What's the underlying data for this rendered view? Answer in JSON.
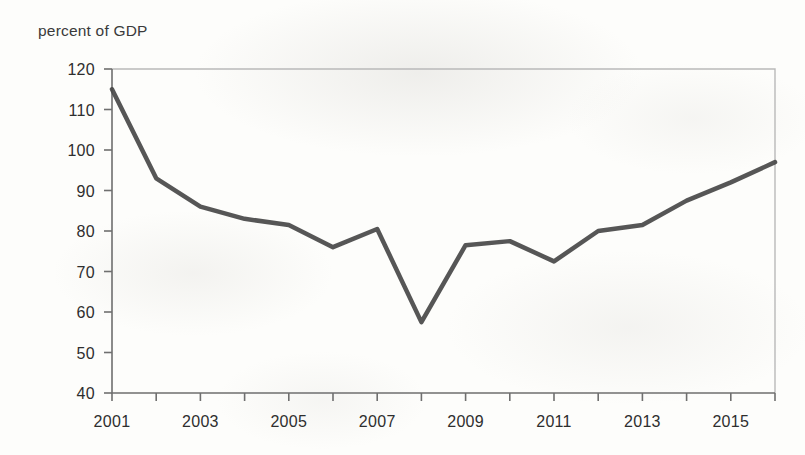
{
  "chart_data": {
    "type": "line",
    "title": "percent of GDP",
    "xlabel": "",
    "ylabel": "percent of GDP",
    "x": [
      2001,
      2002,
      2003,
      2004,
      2005,
      2006,
      2007,
      2008,
      2009,
      2010,
      2011,
      2012,
      2013,
      2014,
      2015,
      2016
    ],
    "values": [
      115,
      93,
      86,
      83,
      81.5,
      76,
      80.5,
      57.5,
      76.5,
      77.5,
      72.5,
      80,
      81.5,
      87.5,
      92,
      97
    ],
    "series": [
      {
        "name": "percent of GDP",
        "values": [
          115,
          93,
          86,
          83,
          81.5,
          76,
          80.5,
          57.5,
          76.5,
          77.5,
          72.5,
          80,
          81.5,
          87.5,
          92,
          97
        ]
      }
    ],
    "xlim": [
      2001,
      2016
    ],
    "ylim": [
      40,
      120
    ],
    "yticks": [
      40,
      50,
      60,
      70,
      80,
      90,
      100,
      110,
      120
    ],
    "ytick_labels": [
      "40",
      "50",
      "60",
      "70",
      "80",
      "90",
      "100",
      "110",
      "120"
    ],
    "xticks": [
      2001,
      2002,
      2003,
      2004,
      2005,
      2006,
      2007,
      2008,
      2009,
      2010,
      2011,
      2012,
      2013,
      2014,
      2015,
      2016
    ],
    "xtick_labels_shown": [
      "2001",
      "2003",
      "2005",
      "2007",
      "2009",
      "2011",
      "2013",
      "2015"
    ],
    "xtick_label_years": [
      2001,
      2003,
      2005,
      2007,
      2009,
      2011,
      2013,
      2015
    ],
    "grid": false,
    "legend": null,
    "line_color": "#484848",
    "line_width": 4.5,
    "frame_color": "#b9b9b9",
    "axis_color": "#6f6f6f",
    "background_color": "#fdfdfb"
  }
}
